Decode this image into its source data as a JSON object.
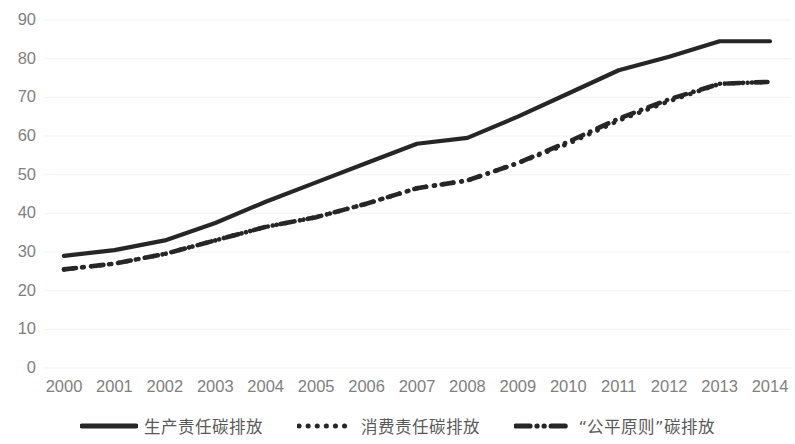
{
  "chart_data": {
    "type": "line",
    "title": "",
    "xlabel": "",
    "ylabel": "",
    "categories": [
      "2000",
      "2001",
      "2002",
      "2003",
      "2004",
      "2005",
      "2006",
      "2007",
      "2008",
      "2009",
      "2010",
      "2011",
      "2012",
      "2013",
      "2014"
    ],
    "x": [
      2000,
      2001,
      2002,
      2003,
      2004,
      2005,
      2006,
      2007,
      2008,
      2009,
      2010,
      2011,
      2012,
      2013,
      2014
    ],
    "ylim": [
      0,
      90
    ],
    "xlim": [
      2000,
      2014
    ],
    "y_ticks": [
      0,
      10,
      20,
      30,
      40,
      50,
      60,
      70,
      80,
      90
    ],
    "y_tick_labels": [
      "0",
      "10",
      "20",
      "30",
      "40",
      "50",
      "60",
      "70",
      "80",
      "90"
    ],
    "grid": true,
    "grid_axis": "y",
    "legend_position": "bottom",
    "series": [
      {
        "name": "生产责任碳排放",
        "style": "solid",
        "color": "#262626",
        "values": [
          29.0,
          30.5,
          33.0,
          37.5,
          43.0,
          48.0,
          53.0,
          58.0,
          59.5,
          65.0,
          71.0,
          77.0,
          80.5,
          84.5,
          84.5
        ]
      },
      {
        "name": "消费责任碳排放",
        "style": "dotted",
        "color": "#262626",
        "values": [
          25.5,
          27.0,
          29.5,
          33.0,
          36.5,
          39.0,
          42.5,
          46.5,
          48.5,
          53.0,
          58.0,
          64.0,
          69.0,
          73.5,
          74.0
        ]
      },
      {
        "name": "“公平原则”碳排放",
        "style": "dash-dot",
        "color": "#262626",
        "values": [
          25.5,
          27.0,
          29.5,
          33.0,
          36.5,
          39.0,
          42.5,
          46.5,
          48.5,
          53.0,
          58.5,
          64.5,
          69.5,
          73.5,
          74.0
        ]
      }
    ]
  },
  "legend": {
    "items": [
      {
        "label": "生产责任碳排放",
        "style": "solid"
      },
      {
        "label": "消费责任碳排放",
        "style": "dotted"
      },
      {
        "label": "“公平原则”碳排放",
        "style": "dash-dot"
      }
    ]
  },
  "colors": {
    "series_line": "#262626",
    "grid_line": "#f2f2f2",
    "tick_label": "#7f7f7f",
    "legend_label": "#595959",
    "background": "#ffffff"
  }
}
